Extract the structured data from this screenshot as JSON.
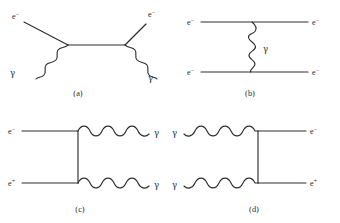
{
  "figure": {
    "background_color": "#ffffff",
    "line_color": "#2e2e30",
    "width": 340,
    "height": 223
  },
  "panels": [
    {
      "id": "a",
      "caption": "(a)",
      "caption_x": 78,
      "caption_y": 95,
      "process": "compton-scattering",
      "labels": [
        {
          "name": "electron-in",
          "text": "e",
          "sup": "−",
          "x": 12,
          "y": 19
        },
        {
          "name": "electron-out",
          "text": "e",
          "sup": "−",
          "x": 148,
          "y": 17
        },
        {
          "name": "photon-in",
          "text": "γ",
          "x": 10,
          "y": 73
        },
        {
          "name": "photon-out",
          "text": "γ",
          "x": 146,
          "y": 78
        }
      ]
    },
    {
      "id": "b",
      "caption": "(b)",
      "caption_x": 250,
      "caption_y": 95,
      "process": "moller-scattering",
      "labels": [
        {
          "name": "electron-in-top",
          "text": "e",
          "sup": "−",
          "x": 189,
          "y": 20
        },
        {
          "name": "electron-out-top",
          "text": "e",
          "sup": "−",
          "x": 312,
          "y": 20
        },
        {
          "name": "electron-in-bottom",
          "text": "e",
          "sup": "−",
          "x": 189,
          "y": 76
        },
        {
          "name": "electron-out-bottom",
          "text": "e",
          "sup": "−",
          "x": 312,
          "y": 76
        },
        {
          "name": "photon-exchange",
          "text": "γ",
          "x": 262,
          "y": 50
        }
      ]
    },
    {
      "id": "c",
      "caption": "(c)",
      "caption_x": 80,
      "caption_y": 211,
      "process": "electron-positron-annihilation",
      "labels": [
        {
          "name": "electron-in",
          "text": "e",
          "sup": "−",
          "x": 10,
          "y": 134
        },
        {
          "name": "positron-in",
          "text": "e",
          "sup": "+",
          "x": 10,
          "y": 188
        },
        {
          "name": "photon-out-top",
          "text": "γ",
          "x": 156,
          "y": 134
        },
        {
          "name": "photon-out-bottom",
          "text": "γ",
          "x": 156,
          "y": 188
        }
      ]
    },
    {
      "id": "d",
      "caption": "(d)",
      "caption_x": 254,
      "caption_y": 211,
      "process": "pair-production",
      "labels": [
        {
          "name": "photon-in-top",
          "text": "γ",
          "x": 174,
          "y": 134
        },
        {
          "name": "photon-in-bottom",
          "text": "γ",
          "x": 174,
          "y": 188
        },
        {
          "name": "electron-out",
          "text": "e",
          "sup": "−",
          "x": 310,
          "y": 134
        },
        {
          "name": "positron-out",
          "text": "e",
          "sup": "+",
          "x": 310,
          "y": 188
        }
      ]
    }
  ],
  "particles": {
    "electron": "e−",
    "positron": "e+",
    "photon": "γ"
  }
}
